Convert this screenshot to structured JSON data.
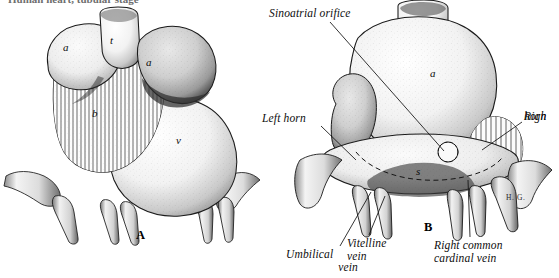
{
  "figure": {
    "title_strip": "Human heart, tubular stage",
    "background_color": "#ffffff",
    "ink_color": "#111111",
    "signature": "H. G."
  },
  "panels": [
    {
      "id": "A",
      "letter": "A",
      "caption_letter_pos": {
        "x": 136,
        "y": 228
      },
      "view": "ventral",
      "structure_labels": [
        {
          "key": "atrium-left",
          "text": "a",
          "x": 63,
          "y": 47
        },
        {
          "key": "truncus",
          "text": "t",
          "x": 110,
          "y": 40
        },
        {
          "key": "atrium-right",
          "text": "a",
          "x": 146,
          "y": 62
        },
        {
          "key": "bulbus",
          "text": "b",
          "x": 92,
          "y": 113
        },
        {
          "key": "ventricle",
          "text": "v",
          "x": 176,
          "y": 140
        }
      ]
    },
    {
      "id": "B",
      "letter": "B",
      "caption_letter_pos": {
        "x": 424,
        "y": 220
      },
      "view": "dorsal",
      "structure_labels": [
        {
          "key": "atrium",
          "text": "a",
          "x": 430,
          "y": 73
        },
        {
          "key": "sinus-venosus",
          "text": "s",
          "x": 416,
          "y": 171
        }
      ],
      "leader_labels": [
        {
          "key": "sinoatrial-orifice",
          "lines": [
            "Sinoatrial orifice"
          ],
          "x": 269,
          "y": 7,
          "align": "left",
          "leader": {
            "x1": 330,
            "y1": 22,
            "x2": 444,
            "y2": 151
          }
        },
        {
          "key": "left-horn",
          "lines": [
            "Left horn"
          ],
          "x": 262,
          "y": 112,
          "align": "left",
          "leader": {
            "x1": 320,
            "y1": 126,
            "x2": 355,
            "y2": 159
          }
        },
        {
          "key": "right-horn",
          "lines": [
            "Righ",
            "horn"
          ],
          "x": 524,
          "y": 110,
          "align": "left",
          "leader": {
            "x1": 522,
            "y1": 122,
            "x2": 482,
            "y2": 149
          }
        },
        {
          "key": "umbilical-vein",
          "lines": [
            "Umbilical",
            "vein"
          ],
          "x": 291,
          "y": 248,
          "align": "right",
          "leader": {
            "x1": 340,
            "y1": 246,
            "x2": 370,
            "y2": 192
          }
        },
        {
          "key": "vitelline-vein",
          "lines": [
            "Vitelline",
            "vein"
          ],
          "x": 347,
          "y": 237,
          "align": "left",
          "leader": {
            "x1": 368,
            "y1": 236,
            "x2": 384,
            "y2": 194
          }
        },
        {
          "key": "right-common-cardinal-vein",
          "lines": [
            "Right common",
            "cardinal vein"
          ],
          "x": 434,
          "y": 239,
          "align": "left",
          "leader": {
            "x1": 470,
            "y1": 238,
            "x2": 468,
            "y2": 178
          }
        }
      ]
    }
  ]
}
